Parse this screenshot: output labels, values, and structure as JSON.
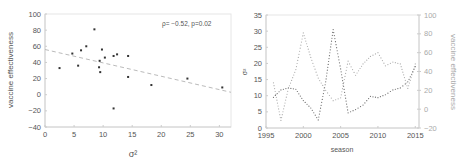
{
  "chart_data": [
    {
      "type": "scatter",
      "title": "",
      "xlabel": "σ²",
      "ylabel": "vaccine effectiveness",
      "xlim": [
        0,
        32
      ],
      "ylim": [
        -40,
        100
      ],
      "xticks": [
        0,
        5,
        10,
        15,
        20,
        25,
        30
      ],
      "yticks": [
        -40,
        -20,
        0,
        20,
        40,
        60,
        80,
        100
      ],
      "grid": false,
      "annotation": "ρ= −0.52, p=0.02",
      "points": [
        {
          "x": 2.5,
          "y": 33
        },
        {
          "x": 4.7,
          "y": 51
        },
        {
          "x": 5.7,
          "y": 36
        },
        {
          "x": 6.2,
          "y": 55
        },
        {
          "x": 7.1,
          "y": 60
        },
        {
          "x": 8.5,
          "y": 81
        },
        {
          "x": 9.4,
          "y": 42
        },
        {
          "x": 9.3,
          "y": 34
        },
        {
          "x": 9.5,
          "y": 28
        },
        {
          "x": 9.8,
          "y": 56
        },
        {
          "x": 10.3,
          "y": 46
        },
        {
          "x": 11.8,
          "y": 48
        },
        {
          "x": 12.4,
          "y": 50
        },
        {
          "x": 11.8,
          "y": -17
        },
        {
          "x": 14.3,
          "y": 48
        },
        {
          "x": 14.3,
          "y": 22
        },
        {
          "x": 18.3,
          "y": 12
        },
        {
          "x": 24.5,
          "y": 20
        },
        {
          "x": 30.5,
          "y": 9
        }
      ],
      "trendline": {
        "x": [
          0,
          32
        ],
        "y": [
          56,
          3
        ],
        "style": "dashed"
      }
    },
    {
      "type": "line",
      "title": "",
      "xlabel": "season",
      "ylabel": "σ²",
      "ylabel_right": "vaccine effectiveness",
      "xlim": [
        1995,
        2015.5
      ],
      "ylim": [
        0,
        35
      ],
      "ylim_right": [
        -20,
        100
      ],
      "xticks": [
        1995,
        2000,
        2005,
        2010,
        2015
      ],
      "yticks": [
        0,
        5,
        10,
        15,
        20,
        25,
        30,
        35
      ],
      "yticks_right": [
        -20,
        0,
        20,
        40,
        60,
        80,
        100
      ],
      "grid": false,
      "x": [
        1996,
        1997,
        1998,
        1999,
        2000,
        2001,
        2002,
        2003,
        2004,
        2005,
        2006,
        2007,
        2008,
        2009,
        2010,
        2011,
        2012,
        2013,
        2014,
        2015
      ],
      "series": [
        {
          "name": "σ²",
          "axis": "left",
          "style": "dotted",
          "color": "#666666",
          "values": [
            9.5,
            11.8,
            12.4,
            12.0,
            8.5,
            6.2,
            2.5,
            14.3,
            30.5,
            18.3,
            4.7,
            5.7,
            7.1,
            9.8,
            9.4,
            10.3,
            11.8,
            12.4,
            14.3,
            19
          ]
        },
        {
          "name": "vaccine effectiveness",
          "axis": "right",
          "style": "dotted",
          "color": "#aaaaaa",
          "values": [
            28,
            -12,
            22,
            42,
            81,
            55,
            33,
            20,
            9,
            12,
            51,
            36,
            48,
            56,
            60,
            46,
            50,
            48,
            22,
            48
          ]
        }
      ]
    }
  ]
}
